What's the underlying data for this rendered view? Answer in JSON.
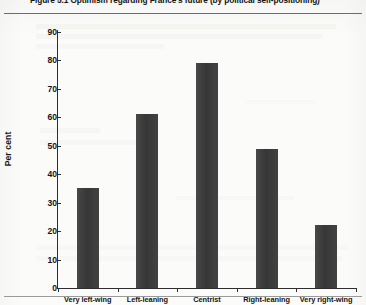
{
  "figure": {
    "number": "Figure 5.1",
    "caption": "Optimism regarding France's future (by political self-positioning)",
    "full_title": "Figure 5.1 Optimism regarding France's future (by political self-positioning)"
  },
  "colors": {
    "bar": "#3a3a3a",
    "axis": "#2e2e2e",
    "page": "#fbfbf9",
    "text": "#141414"
  },
  "chart_data": {
    "type": "bar",
    "title": "Figure 5.1 Optimism regarding France's future (by political self-positioning)",
    "categories": [
      "Very left-wing",
      "Left-leaning",
      "Centrist",
      "Right-leaning",
      "Very right-wing"
    ],
    "values": [
      35,
      61,
      79,
      49,
      22
    ],
    "xlabel": "",
    "ylabel": "Per cent",
    "ylim": [
      0,
      90
    ],
    "ytick_step": 10,
    "yticks": [
      0,
      10,
      20,
      30,
      40,
      50,
      60,
      70,
      80,
      90
    ],
    "ytick_labels": [
      "0",
      "10",
      "20",
      "30",
      "40",
      "50",
      "60",
      "70",
      "80",
      "90"
    ],
    "grid": false,
    "legend": null,
    "series": [
      {
        "name": "Per cent optimistic",
        "values": [
          35,
          61,
          79,
          49,
          22
        ]
      }
    ]
  }
}
